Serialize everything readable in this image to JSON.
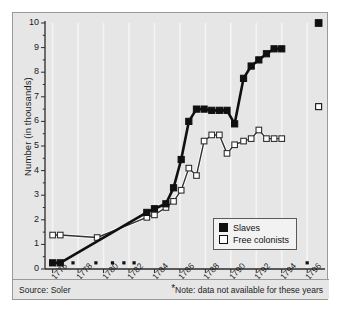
{
  "chart_data": {
    "type": "line",
    "title": "",
    "subtitle": "",
    "xlabel": "",
    "ylabel": "Number (in thousands)",
    "xlim": [
      1775.4,
      1797.4
    ],
    "ylim": [
      0,
      10
    ],
    "grid": "vertical-only",
    "legend_position": "inside-lower-right",
    "x_tick_labels": [
      "1776",
      "1778",
      "1780",
      "1782",
      "1784",
      "1786",
      "1788",
      "1790",
      "1792",
      "1794",
      "1796"
    ],
    "x_tick_values": [
      1776,
      1778,
      1780,
      1782,
      1784,
      1786,
      1788,
      1790,
      1792,
      1794,
      1796
    ],
    "y_tick_labels": [
      "0",
      "1",
      "2",
      "3",
      "4",
      "5",
      "6",
      "7",
      "8",
      "9",
      "10"
    ],
    "y_tick_values": [
      0,
      1,
      2,
      3,
      4,
      5,
      6,
      7,
      8,
      9,
      10
    ],
    "y_minor_step": 0.5,
    "series": [
      {
        "name": "Slaves",
        "marker": "filled-square",
        "color": "#101010",
        "line_color": "#101010",
        "x": [
          1776.0,
          1776.6,
          1783.4,
          1784.0,
          1784.9,
          1785.5,
          1786.1,
          1786.7,
          1787.3,
          1787.9,
          1788.5,
          1789.1,
          1789.7,
          1790.3,
          1791.0,
          1791.6,
          1792.2,
          1792.8,
          1793.4,
          1794.0
        ],
        "y": [
          0.25,
          0.25,
          2.3,
          2.45,
          2.65,
          3.3,
          4.45,
          6.0,
          6.5,
          6.5,
          6.45,
          6.45,
          6.45,
          5.9,
          7.75,
          8.25,
          8.5,
          8.75,
          8.95,
          8.95
        ]
      },
      {
        "name": "Free colonists",
        "marker": "open-square",
        "color": "#ffffff",
        "line_color": "#303030",
        "x": [
          1776.0,
          1776.6,
          1779.5,
          1783.4,
          1784.0,
          1784.9,
          1785.5,
          1786.1,
          1786.7,
          1787.3,
          1787.9,
          1788.5,
          1789.1,
          1789.7,
          1790.3,
          1791.0,
          1791.6,
          1792.2,
          1792.8,
          1793.4,
          1794.0
        ],
        "y": [
          1.38,
          1.38,
          1.28,
          2.1,
          2.2,
          2.5,
          2.75,
          3.2,
          4.1,
          3.8,
          5.2,
          5.45,
          5.45,
          4.7,
          5.05,
          5.2,
          5.3,
          5.65,
          5.3,
          5.3,
          5.3
        ]
      }
    ],
    "isolated_points": [
      {
        "series": "Slaves",
        "x": 1796.9,
        "y": 10.0,
        "marker": "filled-square"
      },
      {
        "series": "Free colonists",
        "x": 1796.9,
        "y": 6.6,
        "marker": "open-square"
      }
    ],
    "missing_data_markers": {
      "note_symbol": "*",
      "y": 0.25,
      "x": [
        1777.6,
        1779.4,
        1780.7,
        1781.6,
        1782.4,
        1796.0
      ]
    },
    "annotations": {
      "source": "Source: Soler",
      "note": "Note: data not available for these years",
      "note_prefix": "*"
    }
  },
  "legend": {
    "items": [
      {
        "label": "Slaves",
        "swatch": "filled-square"
      },
      {
        "label": "Free colonists",
        "swatch": "open-square"
      }
    ]
  },
  "footer": {
    "source": "Source: Soler",
    "note_prefix": "*",
    "note": "Note: data not available for these years"
  },
  "axes": {
    "y_title": "Number (in thousands)"
  },
  "colors": {
    "plot_background": "#e6e6e6",
    "frame_border": "#9a9a9a",
    "axis": "#2b2b2b",
    "gridline": "#f4f4f4",
    "slaves": "#101010",
    "free_colonists": "#ffffff",
    "text": "#1b1b1b"
  }
}
